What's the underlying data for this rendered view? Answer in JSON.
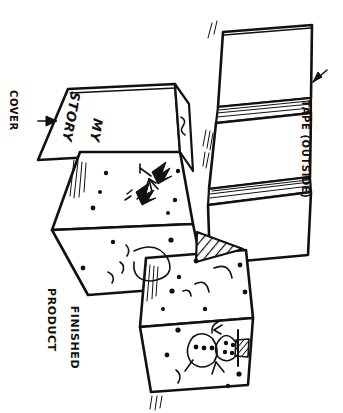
{
  "figure": {
    "kind": "hand-drawn-instructional-diagram",
    "orientation_note": "all lettering is hand printed and rotated 90 degrees clockwise",
    "background_color": "#ffffff",
    "ink_color": "#111111"
  },
  "labels": {
    "cover": "COVER",
    "finished_product_line1": "FINISHED",
    "finished_product_line2": "PRODUCT",
    "tape_outside": "TAPE (OUTSIDE)",
    "cover_title_line1": "MY",
    "cover_title_line2": "STORY"
  },
  "annotations": {
    "cover_arrow": "arrow-pointing-right-to-cover-panel",
    "tape_arrow": "arrow-pointing-left-to-taped-spine"
  },
  "drawings": {
    "cover_panel": "blank cover with hand lettered title",
    "page_two": "two dark evergreen trees with branching twig",
    "page_three": "large circle outline with small arcs",
    "page_four": "arcs and scattered speckles",
    "page_five": "snowman with three buttons, stick arms and hatched block",
    "shaded_triangle": "diagonally hatched triangular flap"
  },
  "tape_detail": {
    "title": "TAPE (OUTSIDE)",
    "strip_count": 2,
    "description": "z-folded book shown from outside with two tape strips across the spine folds"
  }
}
